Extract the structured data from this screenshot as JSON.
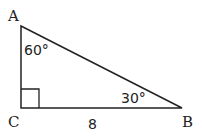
{
  "diagram": {
    "type": "right-triangle",
    "vertices": {
      "A": {
        "label": "A",
        "x": 21,
        "y": 26
      },
      "B": {
        "label": "B",
        "x": 182,
        "y": 108
      },
      "C": {
        "label": "C",
        "x": 21,
        "y": 108
      }
    },
    "angles": {
      "A": "60°",
      "B": "30°",
      "C": "right angle"
    },
    "sides": {
      "CB": "8"
    },
    "stroke_color": "#222222"
  }
}
